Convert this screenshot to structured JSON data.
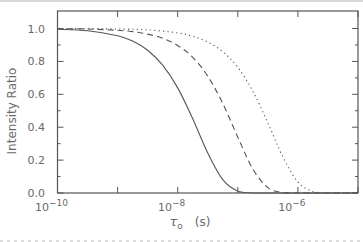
{
  "chart_data": {
    "type": "line",
    "title": "",
    "xlabel": "τ₀ (s)",
    "ylabel": "Intensity Ratio",
    "xscale": "log",
    "xlim_log10": [
      -10,
      -5
    ],
    "ylim": [
      0.0,
      1.05
    ],
    "x_tick_labels": [
      {
        "exp": "-10",
        "log10": -10
      },
      {
        "exp": "-8",
        "log10": -8
      },
      {
        "exp": "-6",
        "log10": -6
      }
    ],
    "x_major_ticks_log10": [
      -10,
      -9,
      -8,
      -7,
      -6,
      -5
    ],
    "y_tick_labels": [
      "0.0",
      "0.2",
      "0.4",
      "0.6",
      "0.8",
      "1.0"
    ],
    "y_ticks": [
      0.0,
      0.2,
      0.4,
      0.6,
      0.8,
      1.0
    ],
    "y_minor_ticks": [
      0.1,
      0.3,
      0.5,
      0.7,
      0.9
    ],
    "grid": false,
    "legend": null,
    "series": [
      {
        "name": "solid",
        "style": "solid",
        "log10_x": [
          -10,
          -9.5,
          -9,
          -8.75,
          -8.5,
          -8.25,
          -8,
          -7.75,
          -7.5,
          -7.25,
          -7,
          -6.75,
          -6.5,
          -6,
          -5.5,
          -5
        ],
        "values": [
          0.995,
          0.986,
          0.956,
          0.924,
          0.868,
          0.777,
          0.639,
          0.452,
          0.243,
          0.081,
          0.011,
          0.0004,
          0,
          0,
          0,
          0
        ]
      },
      {
        "name": "dashed",
        "style": "dashed",
        "log10_x": [
          -10,
          -9.5,
          -9,
          -8.75,
          -8.5,
          -8.25,
          -8,
          -7.75,
          -7.5,
          -7.25,
          -7,
          -6.75,
          -6.5,
          -6.25,
          -6,
          -5.5,
          -5
        ],
        "values": [
          0.999,
          0.997,
          0.989,
          0.981,
          0.966,
          0.941,
          0.897,
          0.825,
          0.71,
          0.544,
          0.339,
          0.146,
          0.033,
          0.0023,
          0,
          0,
          0
        ]
      },
      {
        "name": "dotted",
        "style": "dotted",
        "log10_x": [
          -10,
          -9,
          -8.5,
          -8,
          -7.75,
          -7.5,
          -7.25,
          -7,
          -6.75,
          -6.5,
          -6.25,
          -6,
          -5.75,
          -5.5,
          -5.25,
          -5
        ],
        "values": [
          1.0,
          0.997,
          0.992,
          0.973,
          0.953,
          0.918,
          0.859,
          0.764,
          0.619,
          0.426,
          0.219,
          0.067,
          0.008,
          0.0002,
          0,
          0
        ]
      }
    ]
  },
  "labels": {
    "y_axis": "Intensity Ratio",
    "x_axis_symbol": "τ",
    "x_axis_subscript": "o",
    "x_axis_unit": "(s)",
    "x_tick_base": "10"
  }
}
